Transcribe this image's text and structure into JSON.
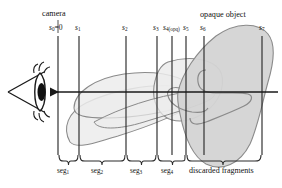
{
  "figure": {
    "kind": "ray-casting-slab-diagram",
    "background_color": "#ffffff",
    "line_color": "#1a1a1a",
    "shape_stroke_color": "#8c8c8c",
    "shape_fill_color": "#e9e9e9",
    "opaque_fill_color": "#d0d0d0",
    "width": 282,
    "height": 188
  },
  "annotations": {
    "camera_label": "camera",
    "opaque_label": "opaque object",
    "discarded_label": "discarded fragments"
  },
  "planes": [
    {
      "id": "s0",
      "base": "s",
      "sub": "0",
      "suffix": "=0",
      "x": 58
    },
    {
      "id": "s1",
      "base": "s",
      "sub": "1",
      "suffix": "",
      "x": 79
    },
    {
      "id": "s2",
      "base": "s",
      "sub": "2",
      "suffix": "",
      "x": 126
    },
    {
      "id": "s3",
      "base": "s",
      "sub": "3",
      "suffix": "",
      "x": 157
    },
    {
      "id": "s4",
      "base": "s",
      "sub": "4(opq)",
      "suffix": "",
      "x": 172
    },
    {
      "id": "s5",
      "base": "s",
      "sub": "5",
      "suffix": "",
      "x": 186
    },
    {
      "id": "s6",
      "base": "s",
      "sub": "6",
      "suffix": "",
      "x": 204
    },
    {
      "id": "s7",
      "base": "s",
      "sub": "7",
      "suffix": "",
      "x": 262
    }
  ],
  "segments": [
    {
      "id": "seg1",
      "base": "seg",
      "sub": "1",
      "from": 58,
      "to": 79
    },
    {
      "id": "seg2",
      "base": "seg",
      "sub": "2",
      "from": 79,
      "to": 126
    },
    {
      "id": "seg3",
      "base": "seg",
      "sub": "3",
      "from": 126,
      "to": 157
    },
    {
      "id": "seg4",
      "base": "seg",
      "sub": "4",
      "from": 157,
      "to": 186
    },
    {
      "id": "discarded",
      "base": "discarded fragments",
      "sub": "",
      "from": 186,
      "to": 262
    }
  ],
  "ray": {
    "y": 92,
    "x_start": 38,
    "x_end": 278,
    "arrow_direction": "left"
  },
  "camera": {
    "eye_center_x": 41,
    "eye_center_y": 92,
    "frustum_apex_x": 8
  }
}
